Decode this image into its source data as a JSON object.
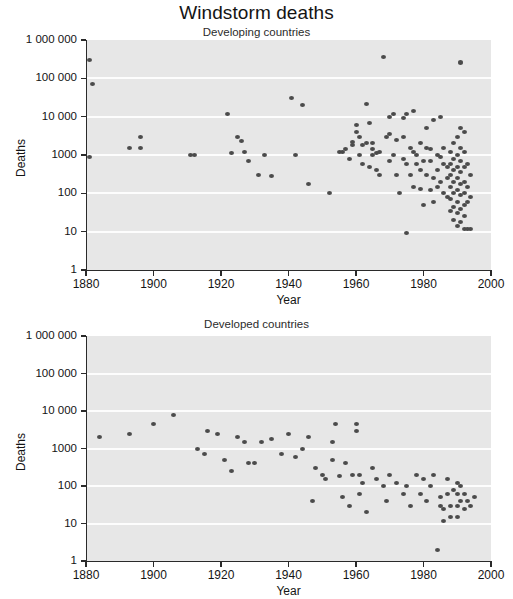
{
  "figure": {
    "title": "Windstorm deaths"
  },
  "chart_data": [
    {
      "type": "scatter",
      "title": "Developing countries",
      "xlabel": "Year",
      "ylabel": "Deaths",
      "xlim": [
        1880,
        2000
      ],
      "ylim": [
        1,
        1000000
      ],
      "yscale": "log",
      "xticks": [
        1880,
        1900,
        1920,
        1940,
        1960,
        1980,
        2000
      ],
      "xticklabels": [
        "1880",
        "1900",
        "1920",
        "1940",
        "1960",
        "1980",
        "2000"
      ],
      "yticks": [
        1,
        10,
        100,
        1000,
        10000,
        100000,
        1000000
      ],
      "yticklabels": [
        "1",
        "10",
        "100",
        "1000",
        "10 000",
        "100 000",
        "1 000 000"
      ],
      "grid": "horizontal-white",
      "legend": "none",
      "points": [
        [
          1881,
          300000
        ],
        [
          1882,
          70000
        ],
        [
          1881,
          900
        ],
        [
          1893,
          1500
        ],
        [
          1896,
          3000
        ],
        [
          1896,
          1500
        ],
        [
          1911,
          1000
        ],
        [
          1912,
          1000
        ],
        [
          1922,
          12000
        ],
        [
          1923,
          1100
        ],
        [
          1925,
          3000
        ],
        [
          1926,
          2300
        ],
        [
          1927,
          1200
        ],
        [
          1928,
          700
        ],
        [
          1931,
          300
        ],
        [
          1933,
          1000
        ],
        [
          1935,
          280
        ],
        [
          1941,
          30000
        ],
        [
          1942,
          1000
        ],
        [
          1944,
          20000
        ],
        [
          1946,
          170
        ],
        [
          1952,
          100
        ],
        [
          1955,
          1200
        ],
        [
          1956,
          1200
        ],
        [
          1957,
          1400
        ],
        [
          1958,
          800
        ],
        [
          1959,
          1800
        ],
        [
          1959,
          2200
        ],
        [
          1960,
          6000
        ],
        [
          1960,
          4000
        ],
        [
          1961,
          3000
        ],
        [
          1961,
          1000
        ],
        [
          1962,
          600
        ],
        [
          1962,
          1800
        ],
        [
          1963,
          2000
        ],
        [
          1963,
          22000
        ],
        [
          1964,
          500
        ],
        [
          1964,
          7000
        ],
        [
          1965,
          1000
        ],
        [
          1965,
          2000
        ],
        [
          1965,
          1400
        ],
        [
          1966,
          1100
        ],
        [
          1966,
          400
        ],
        [
          1967,
          1200
        ],
        [
          1967,
          300
        ],
        [
          1968,
          350000
        ],
        [
          1969,
          3000
        ],
        [
          1970,
          3500
        ],
        [
          1970,
          10000
        ],
        [
          1970,
          700
        ],
        [
          1971,
          12000
        ],
        [
          1971,
          1000
        ],
        [
          1972,
          2500
        ],
        [
          1972,
          300
        ],
        [
          1973,
          100
        ],
        [
          1974,
          9000
        ],
        [
          1974,
          3000
        ],
        [
          1974,
          800
        ],
        [
          1975,
          12000
        ],
        [
          1975,
          600
        ],
        [
          1975,
          9
        ],
        [
          1976,
          1500
        ],
        [
          1976,
          300
        ],
        [
          1977,
          14000
        ],
        [
          1977,
          1200
        ],
        [
          1977,
          150
        ],
        [
          1978,
          600
        ],
        [
          1978,
          1000
        ],
        [
          1979,
          2000
        ],
        [
          1979,
          400
        ],
        [
          1979,
          130
        ],
        [
          1980,
          700
        ],
        [
          1980,
          50
        ],
        [
          1981,
          5000
        ],
        [
          1981,
          1500
        ],
        [
          1981,
          300
        ],
        [
          1982,
          1400
        ],
        [
          1982,
          700
        ],
        [
          1982,
          120
        ],
        [
          1983,
          8000
        ],
        [
          1983,
          250
        ],
        [
          1983,
          60
        ],
        [
          1984,
          1000
        ],
        [
          1984,
          400
        ],
        [
          1984,
          150
        ],
        [
          1985,
          10000
        ],
        [
          1985,
          900
        ],
        [
          1985,
          200
        ],
        [
          1986,
          1500
        ],
        [
          1986,
          600
        ],
        [
          1986,
          100
        ],
        [
          1987,
          500
        ],
        [
          1987,
          250
        ],
        [
          1987,
          80
        ],
        [
          1988,
          1200
        ],
        [
          1988,
          600
        ],
        [
          1988,
          300
        ],
        [
          1988,
          150
        ],
        [
          1988,
          70
        ],
        [
          1988,
          35
        ],
        [
          1989,
          2000
        ],
        [
          1989,
          800
        ],
        [
          1989,
          400
        ],
        [
          1989,
          200
        ],
        [
          1989,
          100
        ],
        [
          1989,
          45
        ],
        [
          1989,
          20
        ],
        [
          1990,
          3000
        ],
        [
          1990,
          1000
        ],
        [
          1990,
          500
        ],
        [
          1990,
          250
        ],
        [
          1990,
          120
        ],
        [
          1990,
          60
        ],
        [
          1990,
          30
        ],
        [
          1990,
          14
        ],
        [
          1991,
          250000
        ],
        [
          1991,
          260000
        ],
        [
          1991,
          5000
        ],
        [
          1991,
          1500
        ],
        [
          1991,
          700
        ],
        [
          1991,
          350
        ],
        [
          1991,
          180
        ],
        [
          1991,
          90
        ],
        [
          1991,
          40
        ],
        [
          1991,
          18
        ],
        [
          1992,
          4000
        ],
        [
          1992,
          1200
        ],
        [
          1992,
          500
        ],
        [
          1992,
          200
        ],
        [
          1992,
          100
        ],
        [
          1992,
          50
        ],
        [
          1992,
          25
        ],
        [
          1992,
          12
        ],
        [
          1993,
          600
        ],
        [
          1993,
          150
        ],
        [
          1993,
          60
        ],
        [
          1993,
          12
        ],
        [
          1994,
          300
        ],
        [
          1994,
          80
        ],
        [
          1994,
          12
        ]
      ]
    },
    {
      "type": "scatter",
      "title": "Developed countries",
      "xlabel": "Year",
      "ylabel": "Deaths",
      "xlim": [
        1880,
        2000
      ],
      "ylim": [
        1,
        1000000
      ],
      "yscale": "log",
      "xticks": [
        1880,
        1900,
        1920,
        1940,
        1960,
        1980,
        2000
      ],
      "xticklabels": [
        "1880",
        "1900",
        "1920",
        "1940",
        "1960",
        "1980",
        "2000"
      ],
      "yticks": [
        1,
        10,
        100,
        1000,
        10000,
        100000,
        1000000
      ],
      "yticklabels": [
        "1",
        "10",
        "100",
        "1000",
        "10 000",
        "100 000",
        "1 000 000"
      ],
      "grid": "horizontal-white",
      "legend": "none",
      "points": [
        [
          1884,
          2000
        ],
        [
          1893,
          2500
        ],
        [
          1900,
          4500
        ],
        [
          1906,
          8000
        ],
        [
          1913,
          1000
        ],
        [
          1915,
          700
        ],
        [
          1916,
          3000
        ],
        [
          1919,
          2500
        ],
        [
          1921,
          500
        ],
        [
          1923,
          250
        ],
        [
          1925,
          2000
        ],
        [
          1927,
          1500
        ],
        [
          1928,
          400
        ],
        [
          1930,
          400
        ],
        [
          1932,
          1500
        ],
        [
          1935,
          1800
        ],
        [
          1938,
          700
        ],
        [
          1940,
          2500
        ],
        [
          1942,
          600
        ],
        [
          1944,
          1000
        ],
        [
          1946,
          2000
        ],
        [
          1947,
          40
        ],
        [
          1948,
          300
        ],
        [
          1950,
          200
        ],
        [
          1951,
          150
        ],
        [
          1953,
          500
        ],
        [
          1953,
          1500
        ],
        [
          1954,
          4500
        ],
        [
          1955,
          180
        ],
        [
          1956,
          50
        ],
        [
          1957,
          400
        ],
        [
          1958,
          30
        ],
        [
          1959,
          200
        ],
        [
          1960,
          3000
        ],
        [
          1960,
          4500
        ],
        [
          1961,
          60
        ],
        [
          1961,
          200
        ],
        [
          1962,
          120
        ],
        [
          1963,
          20
        ],
        [
          1965,
          300
        ],
        [
          1966,
          150
        ],
        [
          1968,
          100
        ],
        [
          1969,
          40
        ],
        [
          1970,
          200
        ],
        [
          1972,
          120
        ],
        [
          1974,
          60
        ],
        [
          1975,
          100
        ],
        [
          1976,
          30
        ],
        [
          1978,
          200
        ],
        [
          1979,
          60
        ],
        [
          1980,
          150
        ],
        [
          1981,
          40
        ],
        [
          1982,
          100
        ],
        [
          1983,
          200
        ],
        [
          1984,
          2
        ],
        [
          1985,
          50
        ],
        [
          1985,
          30
        ],
        [
          1986,
          25
        ],
        [
          1986,
          12
        ],
        [
          1987,
          150
        ],
        [
          1987,
          60
        ],
        [
          1988,
          30
        ],
        [
          1988,
          15
        ],
        [
          1989,
          80
        ],
        [
          1990,
          120
        ],
        [
          1990,
          60
        ],
        [
          1990,
          30
        ],
        [
          1990,
          15
        ],
        [
          1991,
          100
        ],
        [
          1991,
          40
        ],
        [
          1992,
          60
        ],
        [
          1992,
          25
        ],
        [
          1993,
          40
        ],
        [
          1994,
          30
        ],
        [
          1995,
          50
        ]
      ]
    }
  ]
}
